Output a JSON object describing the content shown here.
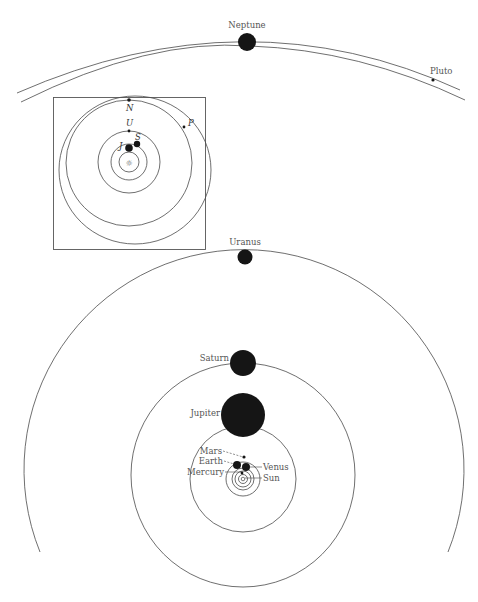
{
  "diagram": {
    "outer_system": {
      "labels": {
        "neptune": "Neptune",
        "pluto": "Pluto"
      }
    },
    "inset": {
      "labels": {
        "neptune": "N",
        "uranus": "U",
        "saturn": "S",
        "jupiter": "J",
        "pluto": "P",
        "sun": "☼"
      }
    },
    "main_system": {
      "labels": {
        "uranus": "Uranus",
        "saturn": "Saturn",
        "jupiter": "Jupiter",
        "mars": "Mars",
        "earth": "Earth",
        "mercury": "Mercury",
        "venus": "Venus",
        "sun": "Sun"
      }
    },
    "colors": {
      "ink": "#151515",
      "orbit": "#4a4a4a",
      "label": "#555555",
      "background": "#ffffff"
    }
  }
}
